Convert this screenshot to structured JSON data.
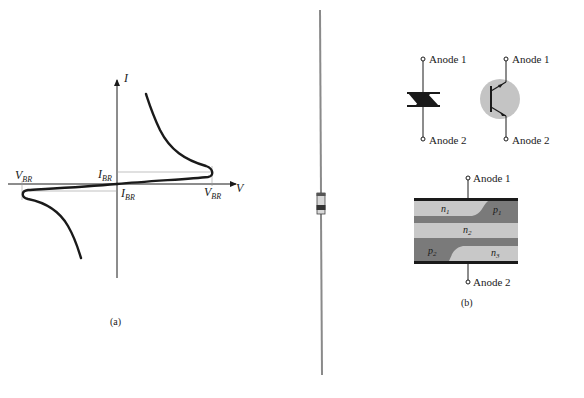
{
  "figure_a": {
    "caption": "(a)",
    "axis_v_label": "V",
    "axis_i_label": "I",
    "vbr_left_main": "V",
    "vbr_left_sub": "BR",
    "vbr_right_main": "V",
    "vbr_right_sub": "BR",
    "ibr_top_main": "I",
    "ibr_top_sub": "BR",
    "ibr_bottom_main": "I",
    "ibr_bottom_sub": "BR"
  },
  "figure_b": {
    "caption": "(b)",
    "diac_anode1": "Anode 1",
    "diac_anode2": "Anode 2",
    "transistor_anode1": "Anode 1",
    "transistor_anode2": "Anode 2",
    "structure_anode1": "Anode 1",
    "structure_anode2": "Anode 2",
    "region_n1_main": "n",
    "region_n1_sub": "1",
    "region_p1_main": "p",
    "region_p1_sub": "1",
    "region_n2_main": "n",
    "region_n2_sub": "2",
    "region_p2_main": "p",
    "region_p2_sub": "2",
    "region_n3_main": "n",
    "region_n3_sub": "3"
  },
  "colors": {
    "ink": "#1a1a1a",
    "light_region": "#c8c8c8",
    "dark_region": "#7a7a7a",
    "transistor_fill": "#c4c4c4"
  }
}
